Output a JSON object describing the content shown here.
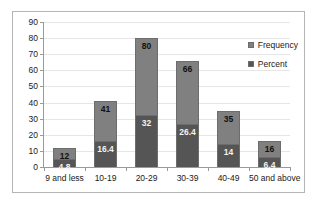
{
  "chart_data": {
    "type": "bar",
    "stacked": true,
    "title": "",
    "xlabel": "",
    "ylabel": "",
    "ylim": [
      0,
      90
    ],
    "ytick_step": 10,
    "yticks": [
      90,
      80,
      70,
      60,
      50,
      40,
      30,
      20,
      10,
      0
    ],
    "grid": true,
    "legend_position": "top-right-inside",
    "categories": [
      "9 and less",
      "10-19",
      "20-29",
      "30-39",
      "40-49",
      "50 and above"
    ],
    "series": [
      {
        "name": "Frequency",
        "color": "#808080",
        "values": [
          12,
          41,
          80,
          66,
          35,
          16
        ],
        "labels": [
          "12",
          "41",
          "80",
          "66",
          "35",
          "16"
        ]
      },
      {
        "name": "Percent",
        "color": "#555555",
        "values": [
          4.8,
          16.4,
          32,
          26.4,
          14,
          6.4
        ],
        "labels": [
          "4.8",
          "16.4",
          "32",
          "26.4",
          "14",
          "6.4"
        ]
      }
    ]
  },
  "legend": {
    "items": [
      {
        "label": "Frequency"
      },
      {
        "label": "Percent"
      }
    ]
  },
  "colors": {
    "frequency": "#808080",
    "percent": "#555555",
    "grid": "#e6e6e6",
    "axis": "#9a9a9a",
    "border": "#b5b5b5"
  }
}
